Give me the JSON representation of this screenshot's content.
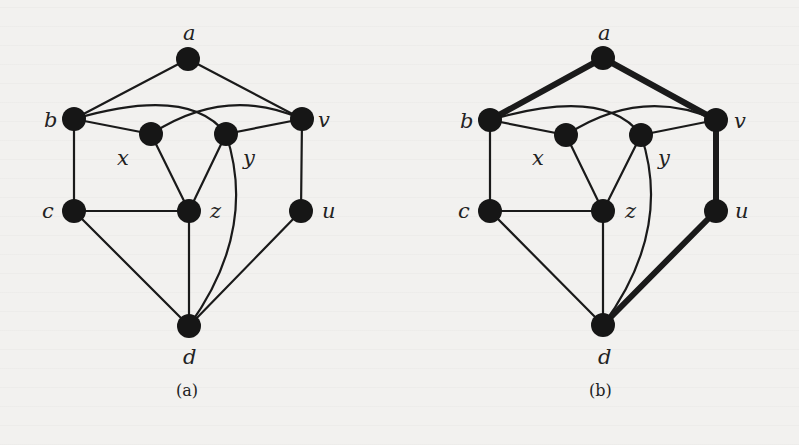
{
  "figure": {
    "panels": [
      {
        "id": "a",
        "caption": "(a)",
        "nodes": [
          {
            "id": "a",
            "label": "a",
            "x": 188,
            "y": 59,
            "lx": 183,
            "ly": 40
          },
          {
            "id": "b",
            "label": "b",
            "x": 74,
            "y": 119,
            "lx": 44,
            "ly": 127
          },
          {
            "id": "v",
            "label": "v",
            "x": 302,
            "y": 119,
            "lx": 318,
            "ly": 127
          },
          {
            "id": "x",
            "label": "x",
            "x": 151,
            "y": 134,
            "lx": 117,
            "ly": 165
          },
          {
            "id": "y",
            "label": "y",
            "x": 226,
            "y": 134,
            "lx": 243,
            "ly": 165
          },
          {
            "id": "c",
            "label": "c",
            "x": 74,
            "y": 211,
            "lx": 42,
            "ly": 218
          },
          {
            "id": "z",
            "label": "z",
            "x": 189,
            "y": 211,
            "lx": 210,
            "ly": 218
          },
          {
            "id": "u",
            "label": "u",
            "x": 301,
            "y": 211,
            "lx": 322,
            "ly": 218
          },
          {
            "id": "d",
            "label": "d",
            "x": 189,
            "y": 326,
            "lx": 183,
            "ly": 364
          }
        ],
        "edges": [
          {
            "from": "a",
            "to": "b"
          },
          {
            "from": "a",
            "to": "v"
          },
          {
            "from": "b",
            "to": "x"
          },
          {
            "from": "b",
            "to": "y",
            "curve": [
              190,
              85
            ]
          },
          {
            "from": "x",
            "to": "v",
            "curve": [
              226,
              85
            ]
          },
          {
            "from": "y",
            "to": "v"
          },
          {
            "from": "b",
            "to": "c"
          },
          {
            "from": "v",
            "to": "u"
          },
          {
            "from": "x",
            "to": "z"
          },
          {
            "from": "y",
            "to": "z"
          },
          {
            "from": "c",
            "to": "z"
          },
          {
            "from": "c",
            "to": "d"
          },
          {
            "from": "z",
            "to": "d"
          },
          {
            "from": "y",
            "to": "d",
            "curve": [
              258,
              230
            ]
          },
          {
            "from": "u",
            "to": "d"
          }
        ]
      },
      {
        "id": "b",
        "caption": "(b)",
        "nodes": [
          {
            "id": "a",
            "label": "a",
            "x": 603,
            "y": 58,
            "lx": 598,
            "ly": 40
          },
          {
            "id": "b",
            "label": "b",
            "x": 490,
            "y": 120,
            "lx": 460,
            "ly": 128
          },
          {
            "id": "v",
            "label": "v",
            "x": 716,
            "y": 120,
            "lx": 734,
            "ly": 128
          },
          {
            "id": "x",
            "label": "x",
            "x": 566,
            "y": 135,
            "lx": 532,
            "ly": 165
          },
          {
            "id": "y",
            "label": "y",
            "x": 641,
            "y": 135,
            "lx": 658,
            "ly": 165
          },
          {
            "id": "c",
            "label": "c",
            "x": 490,
            "y": 211,
            "lx": 458,
            "ly": 218
          },
          {
            "id": "z",
            "label": "z",
            "x": 603,
            "y": 211,
            "lx": 625,
            "ly": 218
          },
          {
            "id": "u",
            "label": "u",
            "x": 716,
            "y": 211,
            "lx": 735,
            "ly": 218
          },
          {
            "id": "d",
            "label": "d",
            "x": 603,
            "y": 325,
            "lx": 598,
            "ly": 364
          }
        ],
        "edges": [
          {
            "from": "a",
            "to": "b",
            "bold": true
          },
          {
            "from": "a",
            "to": "v",
            "bold": true
          },
          {
            "from": "b",
            "to": "x"
          },
          {
            "from": "b",
            "to": "y",
            "curve": [
              605,
              86
            ]
          },
          {
            "from": "x",
            "to": "v",
            "curve": [
              641,
              86
            ]
          },
          {
            "from": "y",
            "to": "v"
          },
          {
            "from": "b",
            "to": "c"
          },
          {
            "from": "v",
            "to": "u",
            "bold": true
          },
          {
            "from": "x",
            "to": "z"
          },
          {
            "from": "y",
            "to": "z"
          },
          {
            "from": "c",
            "to": "z"
          },
          {
            "from": "c",
            "to": "d"
          },
          {
            "from": "z",
            "to": "d"
          },
          {
            "from": "y",
            "to": "d",
            "curve": [
              673,
              230
            ]
          },
          {
            "from": "u",
            "to": "d",
            "bold": true
          }
        ]
      }
    ],
    "highlight_path_b": [
      "b",
      "a",
      "v",
      "u",
      "d"
    ],
    "colors": {
      "node": "#161616",
      "edge": "#1a1a1a",
      "background": "#f2f1ef"
    }
  }
}
